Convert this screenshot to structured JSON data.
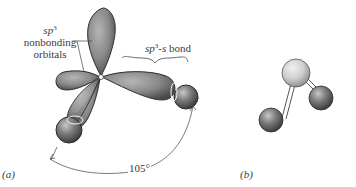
{
  "panel_a": {
    "label": "(a)",
    "nonbonding_label": {
      "line1_italic": "sp",
      "line1_sup": "3",
      "line2": "nonbonding",
      "line3": "orbitals"
    },
    "bond_label": {
      "italic": "sp",
      "sup": "3",
      "suffix_italic": "-s",
      "suffix": " bond"
    },
    "angle_label": "105°"
  },
  "panel_b": {
    "label": "(b)"
  },
  "colors": {
    "orbital_fill": "#8a8a8a",
    "orbital_dark": "#4a4a4a",
    "central_atom_light": "#d6d6d6",
    "outer_atom": "#6a6a6a"
  }
}
